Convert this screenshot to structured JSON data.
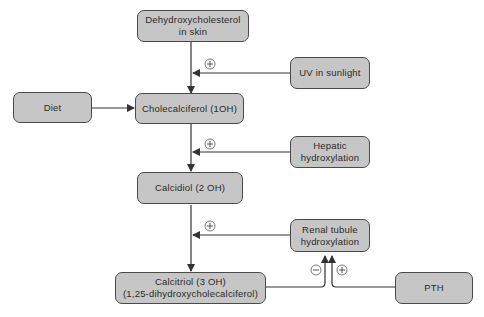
{
  "diagram": {
    "colors": {
      "node_fill": "#c6c6c6",
      "node_border": "#4a4a4a",
      "line": "#333333",
      "text": "#2a2a2a"
    },
    "nodes": {
      "dehydroxycholesterol": {
        "line1": "Dehydroxycholesterol",
        "line2": "in skin"
      },
      "uv": {
        "line1": "UV in sunlight"
      },
      "diet": {
        "line1": "Diet"
      },
      "cholecalciferol": {
        "line1": "Cholecalciferol (1OH)"
      },
      "hepatic": {
        "line1": "Hepatic",
        "line2": "hydroxylation"
      },
      "calcidiol": {
        "line1": "Calcidiol (2 OH)"
      },
      "renal": {
        "line1": "Renal tubule",
        "line2": "hydroxylation"
      },
      "calcitriol": {
        "line1": "Calcitriol (3 OH)",
        "line2": "(1,25-dihydroxycholecalciferol)"
      },
      "pth": {
        "line1": "PTH"
      }
    },
    "signs": {
      "uv_effect": "+",
      "hepatic_effect": "+",
      "renal_effect": "+",
      "calcitriol_feedback": "−",
      "pth_effect": "+"
    }
  }
}
